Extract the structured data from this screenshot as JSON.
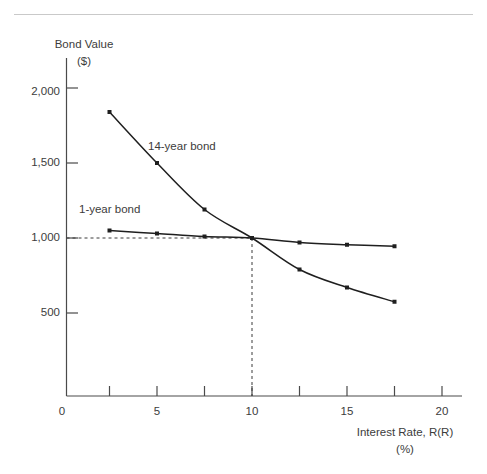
{
  "chart_data": {
    "type": "line",
    "title": "",
    "xlabel": "Interest Rate, R(R)",
    "xlabel_unit": "(%)",
    "ylabel": "Bond Value",
    "ylabel_unit": "($)",
    "xlim": [
      0,
      21
    ],
    "ylim": [
      0,
      2150
    ],
    "grid": false,
    "legend_position": "inline-annotations",
    "x_ticks": [
      0,
      2.5,
      5,
      7.5,
      10,
      12.5,
      15,
      17.5,
      20
    ],
    "x_tick_labels": [
      "0",
      "",
      "5",
      "",
      "10",
      "",
      "15",
      "",
      "20"
    ],
    "y_ticks": [
      500,
      1000,
      1500,
      2000
    ],
    "y_tick_labels": [
      "500",
      "1,000",
      "1,500",
      "2,000"
    ],
    "series": [
      {
        "name": "14-year bond",
        "label": "14-year bond",
        "x": [
          2.5,
          5,
          7.5,
          10,
          12.5,
          15,
          17.5
        ],
        "values": [
          1840,
          1500,
          1190,
          1000,
          790,
          670,
          575
        ]
      },
      {
        "name": "1-year bond",
        "label": "1-year bond",
        "x": [
          2.5,
          5,
          7.5,
          10,
          12.5,
          15,
          17.5
        ],
        "values": [
          1050,
          1030,
          1010,
          1000,
          970,
          955,
          945
        ]
      }
    ],
    "annotations": [
      {
        "name": "intersection-guide",
        "description": "Dashed guide lines marking the intersection of both curves",
        "x": 10,
        "y": 1000
      }
    ]
  },
  "labels": {
    "y_axis_title": "Bond Value",
    "y_axis_unit": "($)",
    "x_axis_title": "Interest Rate, R(R)",
    "x_axis_unit": "(%)",
    "series_14y": "14-year bond",
    "series_1y": "1-year bond",
    "y_tick_2000": "2,000",
    "y_tick_1500": "1,500",
    "y_tick_1000": "1,000",
    "y_tick_500": "500",
    "x_tick_0": "0",
    "x_tick_5": "5",
    "x_tick_10": "10",
    "x_tick_15": "15",
    "x_tick_20": "20"
  },
  "colors": {
    "line": "#1f1f1f",
    "axis": "#4a4a4a",
    "text": "#3c3c3c",
    "rule": "#c9c9c9",
    "background": "#ffffff"
  }
}
